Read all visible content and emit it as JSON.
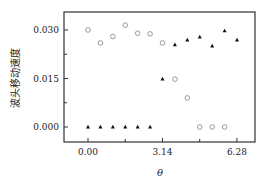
{
  "chart_data": {
    "type": "scatter",
    "title": "",
    "xlabel": "θ",
    "ylabel": "波头移动速度",
    "xlim": [
      -0.5,
      7.2
    ],
    "ylim": [
      -0.0045,
      0.0335
    ],
    "xticks": [
      0.0,
      3.14,
      6.28
    ],
    "xtick_labels": [
      "0.00",
      "3.14",
      "6.28"
    ],
    "xminor_ticks": [
      1.57,
      4.71
    ],
    "yticks": [
      0.0,
      0.015,
      0.03
    ],
    "ytick_labels": [
      "0.000",
      "0.015",
      "0.030"
    ],
    "yminor_ticks": [
      0.0075,
      0.0225
    ],
    "grid": false,
    "legend": null,
    "series": [
      {
        "name": "open-circles",
        "marker": "circle-open",
        "color": "#9a9a9a",
        "x": [
          0.0,
          0.5236,
          1.0472,
          1.5708,
          2.0944,
          2.618,
          3.1416,
          3.6652,
          4.1888,
          4.7124,
          5.236,
          5.7596
        ],
        "y": [
          0.03,
          0.026,
          0.028,
          0.0315,
          0.029,
          0.0288,
          0.026,
          0.0148,
          0.009,
          0.0,
          0.0,
          0.0
        ]
      },
      {
        "name": "filled-triangles",
        "marker": "triangle-filled",
        "color": "#111111",
        "x": [
          0.0,
          0.5236,
          1.0472,
          1.5708,
          2.0944,
          2.618,
          3.1416,
          3.6652,
          4.1888,
          4.7124,
          5.236,
          5.7596,
          6.2832
        ],
        "y": [
          0.0,
          0.0,
          0.0,
          0.0,
          0.0,
          0.0,
          0.0148,
          0.0254,
          0.0269,
          0.0278,
          0.025,
          0.0297,
          0.0269
        ]
      }
    ]
  }
}
